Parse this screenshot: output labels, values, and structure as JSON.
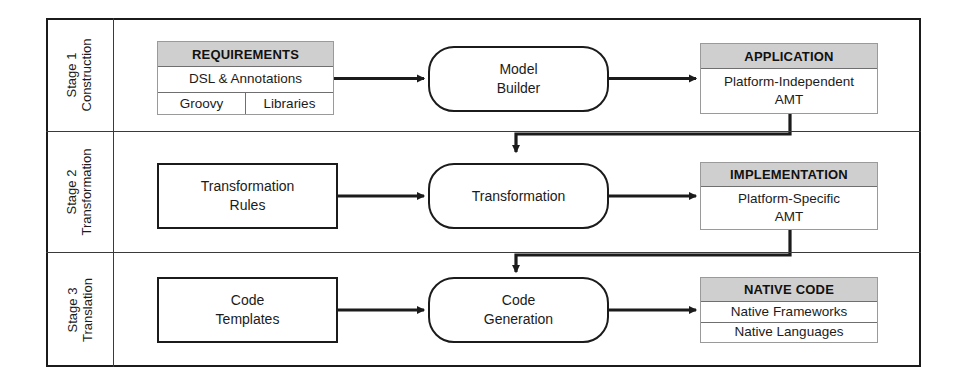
{
  "diagram": {
    "stages": [
      {
        "id": "stage-1",
        "label_line1": "Stage 1",
        "label_line2": "Construction",
        "input_artifact": {
          "header": "REQUIREMENTS",
          "row1": "DSL & Annotations",
          "row2_left": "Groovy",
          "row2_right": "Libraries"
        },
        "process": {
          "line1": "Model",
          "line2": "Builder"
        },
        "output_artifact": {
          "header": "APPLICATION",
          "row1": "Platform-Independent",
          "row2": "AMT"
        }
      },
      {
        "id": "stage-2",
        "label_line1": "Stage 2",
        "label_line2": "Transformation",
        "input_box": {
          "line1": "Transformation",
          "line2": "Rules"
        },
        "process": {
          "line1": "Transformation",
          "line2": ""
        },
        "output_artifact": {
          "header": "IMPLEMENTATION",
          "row1": "Platform-Specific",
          "row2": "AMT"
        }
      },
      {
        "id": "stage-3",
        "label_line1": "Stage 3",
        "label_line2": "Translation",
        "input_box": {
          "line1": "Code",
          "line2": "Templates"
        },
        "process": {
          "line1": "Code",
          "line2": "Generation"
        },
        "output_artifact": {
          "header": "NATIVE CODE",
          "row1": "Native Frameworks",
          "row2": "Native Languages"
        }
      }
    ],
    "colors": {
      "stroke": "#1b1b1b",
      "artifact_border": "#9a9a9a",
      "artifact_header_fill": "#cfcfcf",
      "divider": "#3a3a3a",
      "background": "#ffffff"
    }
  }
}
